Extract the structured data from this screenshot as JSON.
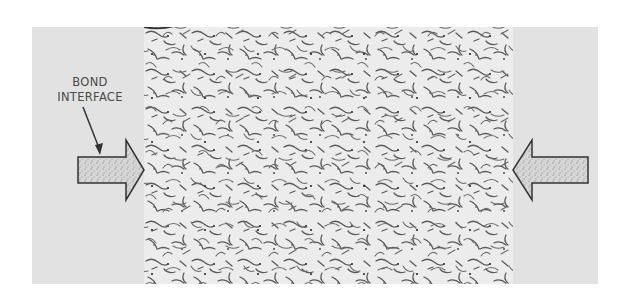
{
  "figure": {
    "label_line1": "BOND",
    "label_line2": "INTERFACE",
    "colors": {
      "background": "#ffffff",
      "panel": "#e2e2e2",
      "micrograph": "#ececec",
      "grain_boundary": "#555555",
      "arrow_outline": "#333333",
      "arrow_fill": "#d0d0d0"
    },
    "arrows": [
      {
        "name": "left-interface-arrow",
        "direction": "right"
      },
      {
        "name": "right-interface-arrow",
        "direction": "left"
      }
    ]
  }
}
